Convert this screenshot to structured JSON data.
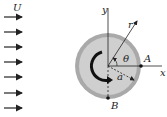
{
  "diagram": {
    "free_stream_label": "U",
    "axis_x_label": "x",
    "axis_y_label": "y",
    "radial_label": "r",
    "angle_label": "θ",
    "radius_label": "a",
    "point_a_label": "A",
    "point_b_label": "B",
    "colors": {
      "outer_ring": "#a9a9a9",
      "inner_disk": "#cfcfcf",
      "ink": "#222222"
    },
    "flow_arrows": 7
  }
}
